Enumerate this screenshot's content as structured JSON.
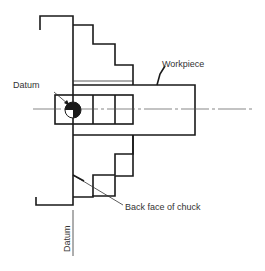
{
  "diagram": {
    "labels": {
      "workpiece": "Workpiece",
      "datum_top": "Datum",
      "back_face": "Back face of chuck",
      "datum_bottom": "Datum"
    },
    "components": [
      "chuck body",
      "chuck jaws (upper)",
      "chuck jaws (lower)",
      "workpiece",
      "datum symbol",
      "centre line",
      "datum line"
    ],
    "colors": {
      "line": "#1a1a1a",
      "text": "#333333",
      "background": "#ffffff"
    }
  }
}
